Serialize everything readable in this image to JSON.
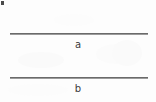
{
  "figure": {
    "background_color": "#fdfdfd",
    "line_color": "#6a6a6a",
    "label_color": "#3c3c3c",
    "artifact_color": "#4a4a4a",
    "segments": [
      {
        "id": "a",
        "label": "a",
        "x_start": 10,
        "x_end": 148,
        "y": 33,
        "length_px": 138
      },
      {
        "id": "b",
        "label": "b",
        "x_start": 10,
        "x_end": 148,
        "y": 77,
        "length_px": 138
      }
    ]
  }
}
